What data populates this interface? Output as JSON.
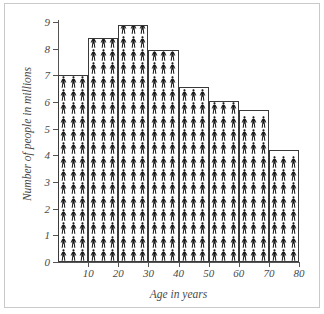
{
  "chart_data": {
    "type": "bar",
    "title": "",
    "subtitle": "",
    "xlabel": "Age in years",
    "ylabel": "Number of people in millions",
    "categories": [
      "0-10",
      "10-20",
      "20-30",
      "30-40",
      "40-50",
      "50-60",
      "60-70",
      "70-80"
    ],
    "bin_edges": [
      0,
      10,
      20,
      30,
      40,
      50,
      60,
      70,
      80
    ],
    "values": [
      7.0,
      8.4,
      8.9,
      7.95,
      6.55,
      6.05,
      5.7,
      4.2
    ],
    "xlim": [
      0,
      80
    ],
    "ylim": [
      0,
      9
    ],
    "xticks": [
      0,
      10,
      20,
      30,
      40,
      50,
      60,
      70,
      80
    ],
    "xtick_labels": [
      "",
      "10",
      "20",
      "30",
      "40",
      "50",
      "60",
      "70",
      "80"
    ],
    "yticks": [
      0,
      1,
      2,
      3,
      4,
      5,
      6,
      7,
      8,
      9
    ],
    "ytick_labels": [
      "0",
      "1",
      "2",
      "3",
      "4",
      "5",
      "6",
      "7",
      "8",
      "9"
    ],
    "grid": false,
    "legend": null,
    "legend_position": "none",
    "marker": "person-pictogram",
    "pictogram_columns_per_bar": 3,
    "pictogram_unit_value": 0.5,
    "bar_edge_color": "#3a3a3a",
    "bar_fill_color": "#ffffff",
    "figure_color": "#1a1a1a",
    "axis_color": "#555555",
    "text_color": "#4a4a4a",
    "background_color": "#ffffff",
    "frame_color": "#c9c9c9"
  },
  "axes": {
    "y_title": "Number of people in millions",
    "x_title": "Age in years",
    "y_ticks": [
      {
        "value": 9,
        "label": "9"
      },
      {
        "value": 8,
        "label": "8"
      },
      {
        "value": 7,
        "label": "7"
      },
      {
        "value": 6,
        "label": "6"
      },
      {
        "value": 5,
        "label": "5"
      },
      {
        "value": 4,
        "label": "4"
      },
      {
        "value": 3,
        "label": "3"
      },
      {
        "value": 2,
        "label": "2"
      },
      {
        "value": 1,
        "label": "1"
      },
      {
        "value": 0,
        "label": "0"
      }
    ],
    "x_ticks": [
      {
        "value": 10,
        "label": "10"
      },
      {
        "value": 20,
        "label": "20"
      },
      {
        "value": 30,
        "label": "30"
      },
      {
        "value": 40,
        "label": "40"
      },
      {
        "value": 50,
        "label": "50"
      },
      {
        "value": 60,
        "label": "60"
      },
      {
        "value": 70,
        "label": "70"
      },
      {
        "value": 80,
        "label": "80"
      }
    ]
  }
}
